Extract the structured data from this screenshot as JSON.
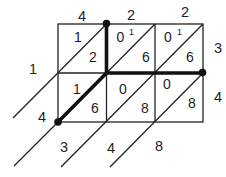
{
  "figure": {
    "type": "lattice-multiplication-grid",
    "top_labels": [
      "4",
      "2",
      "2"
    ],
    "right_labels": [
      "3",
      "4"
    ],
    "left_labels": [
      "1",
      "4"
    ],
    "bottom_labels": [
      "3",
      "4",
      "8"
    ],
    "cells": [
      {
        "tens": "1",
        "ones": "2",
        "carry": ""
      },
      {
        "tens": "0",
        "ones": "6",
        "carry": "1"
      },
      {
        "tens": "0",
        "ones": "6",
        "carry": "1"
      },
      {
        "tens": "1",
        "ones": "6",
        "carry": ""
      },
      {
        "tens": "0",
        "ones": "8",
        "carry": ""
      },
      {
        "tens": "0",
        "ones": "8",
        "carry": ""
      }
    ],
    "colors": {
      "line": "#222222",
      "bold_line": "#111111",
      "text": "#1d1d1d",
      "background": "#ffffff"
    }
  }
}
